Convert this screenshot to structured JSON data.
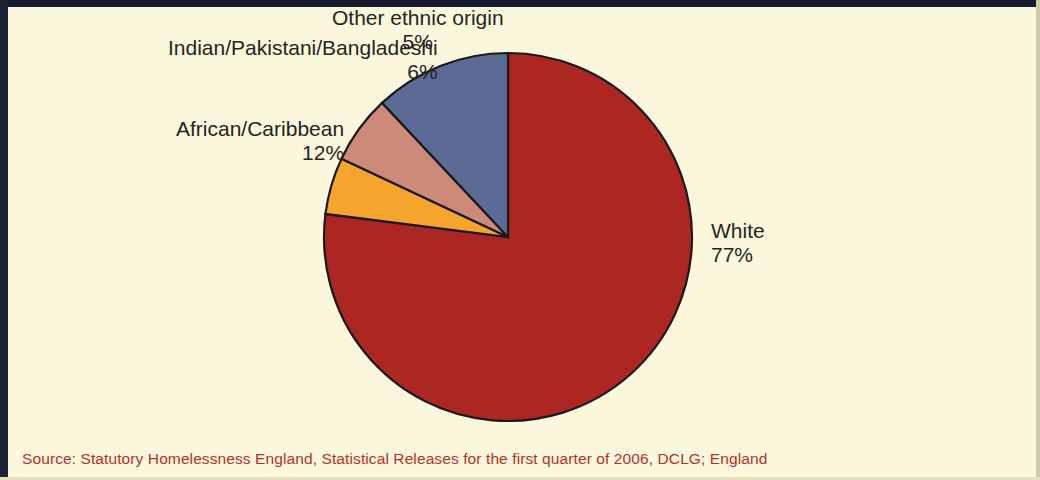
{
  "figure": {
    "background_color": "#faf7dc",
    "frame_color": "#151c30"
  },
  "source": {
    "text": "Source: Statutory Homelessness England, Statistical Releases for the first quarter of 2006, DCLG; England",
    "color": "#b2332a"
  },
  "labels": {
    "white": {
      "name": "White",
      "pct": "77%"
    },
    "african_caribbean": {
      "name": "African/Caribbean",
      "pct": "12%"
    },
    "indian_pakistani_bangladeshi": {
      "name": "Indian/Pakistani/Bangladeshi",
      "pct": "6%"
    },
    "other_ethnic_origin": {
      "name": "Other ethnic origin",
      "pct": "5%"
    }
  },
  "chart_data": {
    "type": "pie",
    "title": "",
    "subtitle": "",
    "xlabel": "",
    "ylabel": "",
    "legend_position": "none",
    "grid": false,
    "value_unit": "percent",
    "start_angle_deg": 0,
    "direction": "clockwise",
    "center": {
      "x": 508,
      "y": 237
    },
    "radius": 184,
    "categories": [
      "White",
      "Other ethnic origin",
      "Indian/Pakistani/Bangladeshi",
      "African/Caribbean"
    ],
    "values": [
      77,
      5,
      6,
      12
    ],
    "data_labels": [
      "77%",
      "5%",
      "6%",
      "12%"
    ],
    "colors": [
      "#ad2722",
      "#f5a52e",
      "#cd8a79",
      "#5c6b96"
    ],
    "slices": [
      {
        "label": "White",
        "value": 77,
        "display": "77%",
        "color": "#ad2722"
      },
      {
        "label": "Other ethnic origin",
        "value": 5,
        "display": "5%",
        "color": "#f5a52e"
      },
      {
        "label": "Indian/Pakistani/Bangladeshi",
        "value": 6,
        "display": "6%",
        "color": "#cd8a79"
      },
      {
        "label": "African/Caribbean",
        "value": 12,
        "display": "12%",
        "color": "#5c6b96"
      }
    ],
    "annotations": [
      "Source: Statutory Homelessness England, Statistical Releases for the first quarter of 2006, DCLG; England"
    ]
  }
}
